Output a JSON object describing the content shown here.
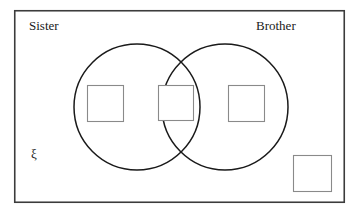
{
  "diagram": {
    "type": "venn-two-set",
    "title_visible": false,
    "background_color": "#ffffff",
    "universal_set": {
      "symbol": "ξ",
      "name": "universal-set-rectangle",
      "border_color": "#3c3c3c",
      "rect": {
        "x": 14,
        "y": 10,
        "width": 331,
        "height": 193
      }
    },
    "sets": [
      {
        "label": "Sister",
        "name": "set-sister",
        "circle": {
          "cx": 137,
          "cy": 107,
          "r": 63
        },
        "stroke_color": "#1a1a1a",
        "label_pos": {
          "x": 29,
          "y": 19
        }
      },
      {
        "label": "Brother",
        "name": "set-brother",
        "circle": {
          "cx": 225,
          "cy": 107,
          "r": 63
        },
        "stroke_color": "#1a1a1a",
        "label_pos": {
          "x": 256,
          "y": 19
        }
      }
    ],
    "answer_boxes": [
      {
        "region": "sister-only",
        "name": "answer-box-sister-only",
        "value": "",
        "rect": {
          "x": 87,
          "y": 85,
          "width": 37,
          "height": 37
        },
        "border_color": "#8a8a8a"
      },
      {
        "region": "sister-and-brother",
        "name": "answer-box-intersection",
        "value": "",
        "rect": {
          "x": 158,
          "y": 85,
          "width": 36,
          "height": 36
        },
        "border_color": "#8a8a8a"
      },
      {
        "region": "brother-only",
        "name": "answer-box-brother-only",
        "value": "",
        "rect": {
          "x": 228,
          "y": 85,
          "width": 37,
          "height": 37
        },
        "border_color": "#8a8a8a"
      },
      {
        "region": "neither",
        "name": "answer-box-outside",
        "value": "",
        "rect": {
          "x": 293,
          "y": 155,
          "width": 39,
          "height": 37
        },
        "border_color": "#8a8a8a"
      }
    ]
  }
}
